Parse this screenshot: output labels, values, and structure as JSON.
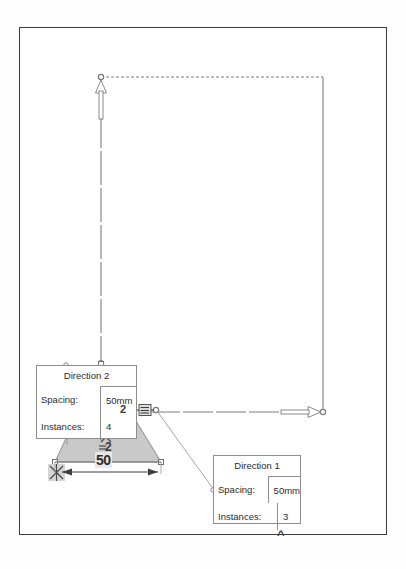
{
  "app": {
    "kind": "cad-sketch-canvas",
    "background": "#ffffff",
    "frame_border_color": "#3c3c3c"
  },
  "canvas": {
    "name": "drawing-canvas",
    "geometry_color": "#6e6e6e",
    "fill_color": "#c9c9c9",
    "node_color": "#8a8a8a"
  },
  "callouts": [
    {
      "id": "direction-2",
      "title": "Direction 2",
      "rows": [
        {
          "label": "Spacing:",
          "value": "50mm"
        },
        {
          "label": "Instances:",
          "value": "4"
        }
      ]
    },
    {
      "id": "direction-1",
      "title": "Direction 1",
      "rows": [
        {
          "label": "Spacing:",
          "value": "50mm"
        },
        {
          "label": "Instances:",
          "value": "3"
        }
      ]
    }
  ],
  "annotations": {
    "instance_marker_2": "2",
    "dim_marker_2": "2",
    "linear_dimension": "50",
    "chevron": "^"
  },
  "icons": {
    "arrow_up": "direction-arrow-up-icon",
    "arrow_right": "direction-arrow-right-icon",
    "fixed_anchor": "fixed-constraint-icon",
    "chain": "linear-pattern-icon",
    "chevron_up": "chevron-up-icon"
  }
}
